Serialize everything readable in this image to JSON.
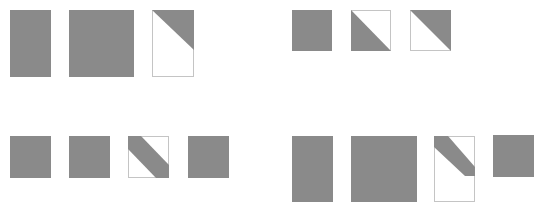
{
  "canvas": {
    "width": 537,
    "height": 208,
    "background": "#ffffff"
  },
  "colors": {
    "fill": "#8a8a8a",
    "border": "#c4c4c4",
    "empty": "#ffffff"
  },
  "groups": [
    {
      "name": "top-left-group",
      "tiles": [
        {
          "kind": "solid",
          "x": 10,
          "y": 10,
          "w": 41,
          "h": 67
        },
        {
          "kind": "solid",
          "x": 69,
          "y": 10,
          "w": 65,
          "h": 67
        },
        {
          "kind": "poly",
          "x": 152,
          "y": 10,
          "w": 42,
          "h": 67,
          "points": "0,0 42,0 42,40"
        }
      ]
    },
    {
      "name": "top-right-group",
      "tiles": [
        {
          "kind": "solid",
          "x": 292,
          "y": 10,
          "w": 40,
          "h": 41
        },
        {
          "kind": "poly",
          "x": 351,
          "y": 10,
          "w": 40,
          "h": 41,
          "points": "0,0 0,41 40,41"
        },
        {
          "kind": "poly",
          "x": 410,
          "y": 10,
          "w": 41,
          "h": 41,
          "points": "0,0 41,0 41,41"
        }
      ]
    },
    {
      "name": "bottom-left-group",
      "tiles": [
        {
          "kind": "solid",
          "x": 10,
          "y": 136,
          "w": 41,
          "h": 42
        },
        {
          "kind": "solid",
          "x": 69,
          "y": 136,
          "w": 41,
          "h": 42
        },
        {
          "kind": "poly",
          "x": 128,
          "y": 136,
          "w": 41,
          "h": 42,
          "points": "0,0 13,0 41,29 41,42 28,42 0,13"
        },
        {
          "kind": "solid",
          "x": 188,
          "y": 136,
          "w": 41,
          "h": 42
        }
      ]
    },
    {
      "name": "bottom-right-group",
      "tiles": [
        {
          "kind": "solid",
          "x": 292,
          "y": 136,
          "w": 41,
          "h": 66
        },
        {
          "kind": "solid",
          "x": 351,
          "y": 136,
          "w": 66,
          "h": 66
        },
        {
          "kind": "poly",
          "x": 434,
          "y": 136,
          "w": 41,
          "h": 66,
          "points": "0,0 14,0 41,31 41,40 31,40 0,11"
        },
        {
          "kind": "solid",
          "x": 493,
          "y": 135,
          "w": 41,
          "h": 42
        }
      ]
    }
  ]
}
